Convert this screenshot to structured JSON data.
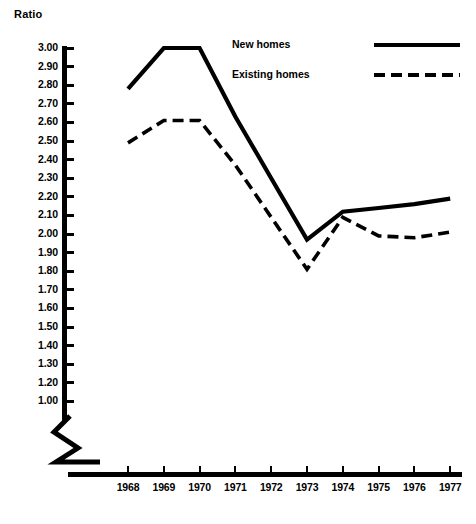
{
  "chart_data": {
    "type": "line",
    "title": "",
    "ylabel": "Ratio",
    "xlabel": "",
    "grid": false,
    "legend_position": "top-right",
    "categories": [
      "1968",
      "1969",
      "1970",
      "1971",
      "1972",
      "1973",
      "1974",
      "1975",
      "1976",
      "1977"
    ],
    "x": [
      1968,
      1969,
      1970,
      1971,
      1972,
      1973,
      1974,
      1975,
      1976,
      1977
    ],
    "ylim": [
      1.0,
      3.0
    ],
    "y_axis_note": "axis broken below 1.20; tick sequence printed as 3.00 down to 1.20 then 1.00",
    "ytick_labels": [
      "3.00",
      "2.90",
      "2.80",
      "2.70",
      "2.60",
      "2.50",
      "2.40",
      "2.30",
      "2.20",
      "2.10",
      "2.00",
      "1.90",
      "1.80",
      "1.70",
      "1.60",
      "1.50",
      "1.40",
      "1.30",
      "1.20",
      "1.00"
    ],
    "ytick_values": [
      3.0,
      2.9,
      2.8,
      2.7,
      2.6,
      2.5,
      2.4,
      2.3,
      2.2,
      2.1,
      2.0,
      1.9,
      1.8,
      1.7,
      1.6,
      1.5,
      1.4,
      1.3,
      1.2,
      1.0
    ],
    "series": [
      {
        "name": "New homes",
        "style": "solid",
        "color": "#000000",
        "values": [
          2.78,
          3.0,
          3.0,
          2.63,
          2.3,
          1.97,
          2.12,
          2.14,
          2.16,
          2.19
        ]
      },
      {
        "name": "Existing homes",
        "style": "dashed",
        "color": "#000000",
        "values": [
          2.49,
          2.61,
          2.61,
          2.37,
          2.09,
          1.81,
          2.09,
          1.99,
          1.98,
          2.01
        ]
      }
    ]
  },
  "legend": {
    "items": [
      {
        "label": "New  homes",
        "style": "solid"
      },
      {
        "label": "Existing homes",
        "style": "dashed"
      }
    ]
  },
  "colors": {
    "ink": "#000000",
    "paper": "#ffffff"
  }
}
